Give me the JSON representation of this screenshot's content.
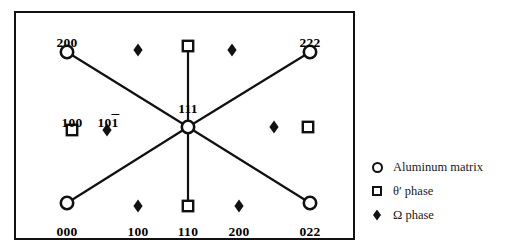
{
  "figure": {
    "type": "electron-diffraction-pattern-schematic",
    "frame": {
      "x": 14,
      "y": 11,
      "width": 341,
      "height": 229
    }
  },
  "chart_data": {
    "type": "scatter",
    "title": "",
    "xlabel": "",
    "ylabel": "",
    "series": [
      {
        "name": "Aluminum matrix",
        "marker": "open-circle",
        "points": [
          {
            "label": "200",
            "label_overbar": false,
            "x": 67,
            "y": 52,
            "label_x": 67,
            "label_y": 36,
            "label_pos": "above"
          },
          {
            "label": "222",
            "label_overbar": false,
            "x": 310,
            "y": 52,
            "label_x": 310,
            "label_y": 36,
            "label_pos": "above"
          },
          {
            "label": "111",
            "label_overbar": false,
            "x": 188,
            "y": 127,
            "label_x": 188,
            "label_y": 102,
            "label_pos": "above"
          },
          {
            "label": "000",
            "label_overbar": false,
            "x": 67,
            "y": 203,
            "label_x": 67,
            "label_y": 225,
            "label_pos": "below"
          },
          {
            "label": "022",
            "label_overbar": false,
            "x": 310,
            "y": 203,
            "label_x": 310,
            "label_y": 225,
            "label_pos": "below"
          }
        ]
      },
      {
        "name": "θ′ phase",
        "marker": "open-square",
        "points": [
          {
            "label": "",
            "label_overbar": false,
            "x": 188,
            "y": 46,
            "label_x": 0,
            "label_y": 0,
            "label_pos": "none"
          },
          {
            "label": "100",
            "label_overbar": false,
            "x": 72,
            "y": 130,
            "label_x": 72,
            "label_y": 116,
            "label_pos": "above"
          },
          {
            "label": "",
            "label_overbar": false,
            "x": 308,
            "y": 127,
            "label_x": 0,
            "label_y": 0,
            "label_pos": "none"
          },
          {
            "label": "110",
            "label_overbar": false,
            "x": 188,
            "y": 206,
            "label_x": 188,
            "label_y": 225,
            "label_pos": "below"
          }
        ]
      },
      {
        "name": "Ω phase",
        "marker": "filled-diamond",
        "points": [
          {
            "label": "",
            "label_overbar": false,
            "x": 138,
            "y": 50,
            "label_x": 0,
            "label_y": 0,
            "label_pos": "none"
          },
          {
            "label": "",
            "label_overbar": false,
            "x": 232,
            "y": 50,
            "label_x": 0,
            "label_y": 0,
            "label_pos": "none"
          },
          {
            "label": "101",
            "label_overbar": true,
            "x": 107,
            "y": 130,
            "label_x": 108,
            "label_y": 116,
            "label_pos": "above"
          },
          {
            "label": "",
            "label_overbar": false,
            "x": 274,
            "y": 127,
            "label_x": 0,
            "label_y": 0,
            "label_pos": "none"
          },
          {
            "label": "100",
            "label_overbar": false,
            "x": 138,
            "y": 206,
            "label_x": 138,
            "label_y": 225,
            "label_pos": "below"
          },
          {
            "label": "200",
            "label_overbar": false,
            "x": 239,
            "y": 206,
            "label_x": 239,
            "label_y": 225,
            "label_pos": "below"
          }
        ]
      }
    ],
    "connector_lines": [
      {
        "from": "200",
        "to": "111",
        "x1": 67,
        "y1": 52,
        "x2": 188,
        "y2": 127
      },
      {
        "from": "222",
        "to": "111",
        "x1": 310,
        "y1": 52,
        "x2": 188,
        "y2": 127
      },
      {
        "from": "000",
        "to": "111",
        "x1": 67,
        "y1": 203,
        "x2": 188,
        "y2": 127
      },
      {
        "from": "022",
        "to": "111",
        "x1": 310,
        "y1": 203,
        "x2": 188,
        "y2": 127
      },
      {
        "from": "theta-top",
        "to": "111",
        "x1": 188,
        "y1": 46,
        "x2": 188,
        "y2": 127
      },
      {
        "from": "111",
        "to": "theta-bottom",
        "x1": 188,
        "y1": 127,
        "x2": 188,
        "y2": 206
      }
    ],
    "grid": false,
    "legend_position": "right"
  },
  "legend": {
    "items": [
      {
        "symbol": "open-circle",
        "label": "Aluminum  matrix"
      },
      {
        "symbol": "open-square",
        "label": "θ′ phase"
      },
      {
        "symbol": "filled-diamond",
        "label": "Ω phase"
      }
    ]
  },
  "colors": {
    "ink": "#111111",
    "background": "#ffffff"
  }
}
